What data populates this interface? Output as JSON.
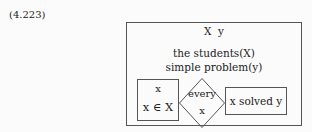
{
  "equation_number": "(4.223)",
  "diagram": {
    "header": "X  y",
    "line1": "the students(X)",
    "line2": "simple problem(y)",
    "left_box": {
      "top": "x",
      "bottom": "x ∈ X"
    },
    "diamond": {
      "top": "every",
      "bottom": "x"
    },
    "right_box": {
      "text": "x solved y"
    }
  }
}
